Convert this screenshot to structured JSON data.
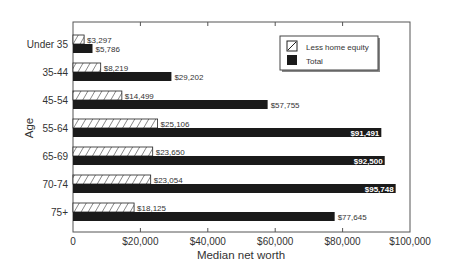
{
  "chart_data": {
    "type": "bar",
    "orientation": "horizontal",
    "title": "",
    "xlabel": "Median net worth",
    "ylabel": "Age",
    "xlim": [
      0,
      100000
    ],
    "xticks": [
      0,
      20000,
      40000,
      60000,
      80000,
      100000
    ],
    "xtick_labels": [
      "0",
      "$20,000",
      "$40,000",
      "$60,000",
      "$80,000",
      "$100,000"
    ],
    "grid": false,
    "legend_position": "upper right (inside)",
    "categories": [
      "Under 35",
      "35-44",
      "45-54",
      "55-64",
      "65-69",
      "70-74",
      "75+"
    ],
    "series": [
      {
        "name": "Less home equity",
        "fill": "hatched",
        "values": [
          3297,
          8219,
          14499,
          25106,
          23650,
          23054,
          18125
        ],
        "labels": [
          "$3,297",
          "$8,219",
          "$14,499",
          "$25,106",
          "$23,650",
          "$23,054",
          "$18,125"
        ]
      },
      {
        "name": "Total",
        "fill": "solid",
        "color": "#1a1a1a",
        "values": [
          5786,
          29202,
          57755,
          91491,
          92500,
          95748,
          77645
        ],
        "labels": [
          "$5,786",
          "$29,202",
          "$57,755",
          "$91,491",
          "$92,500",
          "$95,748",
          "$77,645"
        ],
        "label_inside": [
          false,
          false,
          false,
          true,
          true,
          true,
          false
        ]
      }
    ]
  },
  "legend": {
    "items": [
      {
        "label": "Less home equity",
        "swatch": "hatched"
      },
      {
        "label": "Total",
        "swatch": "solid"
      }
    ]
  },
  "axes": {
    "xlabel": "Median net worth",
    "ylabel": "Age"
  }
}
